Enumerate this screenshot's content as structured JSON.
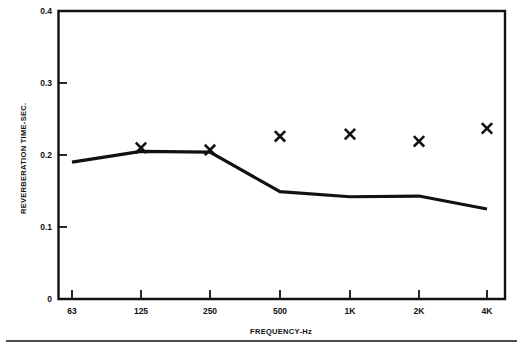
{
  "chart_data": {
    "type": "line",
    "title": "",
    "xlabel": "FREQUENCY-Hz",
    "ylabel": "REVERBERATION TIME-SEC.",
    "categories": [
      "63",
      "125",
      "250",
      "500",
      "1K",
      "2K",
      "4K"
    ],
    "x_tick_labels": [
      "63",
      "125",
      "250",
      "500",
      "1K",
      "2K",
      "4K"
    ],
    "y_tick_labels": [
      "0.4",
      "0.3",
      "0.2",
      "0.1",
      "0"
    ],
    "y_ticks": [
      0.4,
      0.3,
      0.2,
      0.1,
      0
    ],
    "ylim": [
      0,
      0.4
    ],
    "grid": false,
    "legend": false,
    "series": [
      {
        "name": "measured-curve",
        "marker": "none",
        "style": "solid-line",
        "color": "#111111",
        "values": [
          0.19,
          0.205,
          0.204,
          0.149,
          0.142,
          0.143,
          0.125
        ]
      },
      {
        "name": "x-markers",
        "marker": "x",
        "style": "markers-only",
        "color": "#111111",
        "values": [
          null,
          0.21,
          0.207,
          0.226,
          0.229,
          0.219,
          0.237
        ]
      }
    ]
  },
  "axes": {
    "y_axis_title": "REVERBERATION TIME-SEC.",
    "x_axis_title": "FREQUENCY-Hz"
  },
  "y_labels": {
    "t0": "0.4",
    "t1": "0.3",
    "t2": "0.2",
    "t3": "0.1",
    "t4": "0"
  },
  "x_labels": {
    "t0": "63",
    "t1": "125",
    "t2": "250",
    "t3": "500",
    "t4": "1K",
    "t5": "2K",
    "t6": "4K"
  },
  "colors": {
    "ink": "#111111",
    "background": "#ffffff"
  }
}
